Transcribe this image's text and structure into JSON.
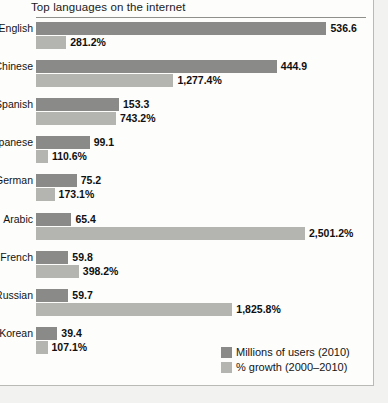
{
  "chart_data": {
    "type": "bar",
    "orientation": "horizontal",
    "title": "Top languages on the internet",
    "xlabel": "",
    "ylabel": "",
    "grid": false,
    "legend_position": "bottom-right",
    "categories": [
      "English",
      "Chinese",
      "Spanish",
      "Japanese",
      "German",
      "Arabic",
      "French",
      "Russian",
      "Korean"
    ],
    "series": [
      {
        "name": "Millions of users (2010)",
        "color": "#8a8a88",
        "values": [
          536.6,
          444.9,
          153.3,
          99.1,
          75.2,
          65.4,
          59.8,
          59.7,
          39.4
        ],
        "labels": [
          "536.6",
          "444.9",
          "153.3",
          "99.1",
          "75.2",
          "65.4",
          "59.8",
          "59.7",
          "39.4"
        ],
        "max": 536.6
      },
      {
        "name": "% growth (2000–2010)",
        "color": "#b4b4b1",
        "values": [
          281.2,
          1277.4,
          743.2,
          110.6,
          173.1,
          2501.2,
          398.2,
          1825.8,
          107.1
        ],
        "labels": [
          "281.2%",
          "1,277.4%",
          "743.2%",
          "110.6%",
          "173.1%",
          "2,501.2%",
          "398.2%",
          "1,825.8%",
          "107.1%"
        ],
        "max": 2501.2
      }
    ]
  },
  "legend": {
    "items": [
      {
        "label": "Millions of users (2010)",
        "color": "#8a8a88"
      },
      {
        "label": "% growth (2000–2010)",
        "color": "#b4b4b1"
      }
    ]
  }
}
